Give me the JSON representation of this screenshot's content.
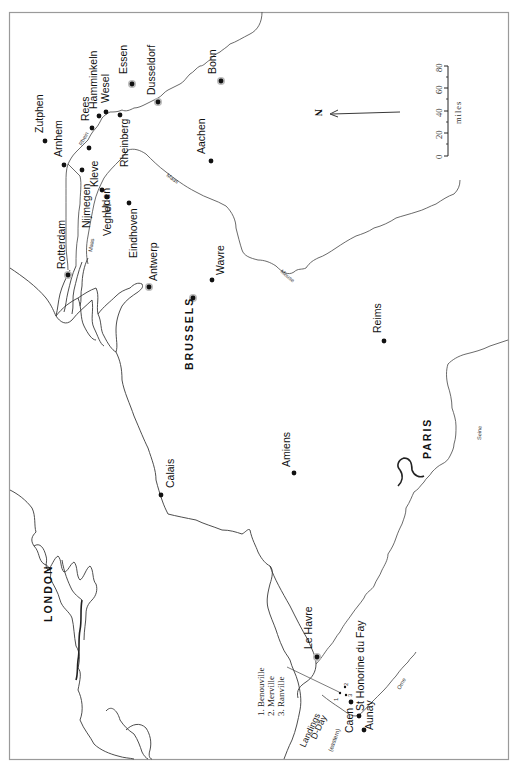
{
  "map": {
    "orientation": "rotated 90° counter-clockwise (north points left)",
    "north_label": "N",
    "scale": {
      "unit_label": "miles",
      "ticks": [
        "0",
        "20",
        "40",
        "60",
        "80"
      ]
    },
    "capitals": [
      {
        "name": "LONDON"
      },
      {
        "name": "BRUSSELS"
      },
      {
        "name": "PARIS"
      }
    ],
    "cities": [
      {
        "name": "Zutphen"
      },
      {
        "name": "Arnhem"
      },
      {
        "name": "Rees"
      },
      {
        "name": "Hamminkeln"
      },
      {
        "name": "Wesel"
      },
      {
        "name": "Essen"
      },
      {
        "name": "Dusseldorf"
      },
      {
        "name": "Bonn"
      },
      {
        "name": "Rheinberg"
      },
      {
        "name": "Kleve"
      },
      {
        "name": "Nijmegen"
      },
      {
        "name": "Uden"
      },
      {
        "name": "Veghel"
      },
      {
        "name": "Eindhoven"
      },
      {
        "name": "Aachen"
      },
      {
        "name": "Rotterdam"
      },
      {
        "name": "Antwerp"
      },
      {
        "name": "Wavre"
      },
      {
        "name": "Reims"
      },
      {
        "name": "Calais"
      },
      {
        "name": "Amiens"
      },
      {
        "name": "Le Havre"
      },
      {
        "name": "Caen"
      },
      {
        "name": "St Honorine du Fay"
      },
      {
        "name": "Aunay"
      }
    ],
    "rivers": [
      {
        "name": "Rhein"
      },
      {
        "name": "Maas"
      },
      {
        "name": "Maas (upper)"
      },
      {
        "name": "Meuse"
      },
      {
        "name": "Seine"
      },
      {
        "name": "Orne"
      }
    ],
    "river_labels": {
      "rhein": "Rhein",
      "maas_lower": "Maas",
      "maas_upper": "Maas",
      "meuse": "Meuse",
      "seine": "Seine",
      "orne": "Orne"
    },
    "dday": {
      "label_line1": "Landings",
      "label_line2": "D-Day",
      "sector_label": "(eastern)",
      "legend": [
        "1. Benouville",
        "2. Merville",
        "3. Ranville"
      ],
      "markers": [
        "1",
        "2",
        "3"
      ]
    }
  }
}
